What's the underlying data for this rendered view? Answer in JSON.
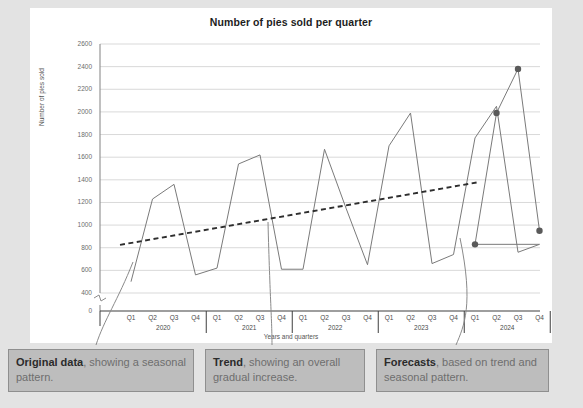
{
  "chart_data": {
    "type": "line",
    "title": "Number of pies sold per quarter",
    "xlabel": "Years and quarters",
    "ylabel": "Number of pies sold",
    "ylim": [
      400,
      2600
    ],
    "y_axis_break_at_zero": true,
    "yticks": [
      0,
      400,
      600,
      800,
      1000,
      1200,
      1400,
      1600,
      1800,
      2000,
      2200,
      2400,
      2600
    ],
    "grid": true,
    "legend_position": "none",
    "x": [
      "Q1 2020",
      "Q2 2020",
      "Q3 2020",
      "Q4 2020",
      "Q1 2021",
      "Q2 2021",
      "Q3 2021",
      "Q4 2021",
      "Q1 2022",
      "Q2 2022",
      "Q3 2022",
      "Q4 2022",
      "Q1 2023",
      "Q2 2023",
      "Q3 2023",
      "Q4 2023",
      "Q1 2024",
      "Q2 2024",
      "Q3 2024",
      "Q4 2024"
    ],
    "quarters": [
      "Q1",
      "Q2",
      "Q3",
      "Q4"
    ],
    "years": [
      "2020",
      "2021",
      "2022",
      "2023",
      "2024"
    ],
    "series": [
      {
        "name": "Original data",
        "style": "solid",
        "markers": false,
        "values": [
          500,
          1230,
          1360,
          560,
          620,
          1540,
          1620,
          610,
          610,
          1670,
          1150,
          650,
          1700,
          1990,
          660,
          740,
          1770,
          2050,
          760,
          830
        ]
      },
      {
        "name": "Forecasts",
        "style": "solid",
        "markers": true,
        "values": [
          null,
          null,
          null,
          null,
          null,
          null,
          null,
          null,
          null,
          null,
          null,
          null,
          null,
          null,
          null,
          null,
          830,
          1990,
          2380,
          950
        ],
        "points": [
          {
            "x": "Q1 2024",
            "y": 830
          },
          {
            "x": "Q2 2024",
            "y": 1990
          },
          {
            "x": "Q3 2024",
            "y": 2380
          },
          {
            "x": "Q4 2024",
            "y": 950
          }
        ]
      },
      {
        "name": "Trend",
        "style": "dashed",
        "markers": false,
        "endpoints": [
          {
            "x": "Q1 2020",
            "y": 825
          },
          {
            "x": "Q1 2024",
            "y": 1380
          }
        ]
      }
    ]
  },
  "callouts": [
    {
      "id": "original-data",
      "emphasis": "Original data",
      "rest": ", showing a seasonal pattern."
    },
    {
      "id": "trend",
      "emphasis": "Trend",
      "rest": ", showing an overall gradual increase."
    },
    {
      "id": "forecasts",
      "emphasis": "Forecasts",
      "rest": ", based on trend and seasonal pattern."
    }
  ],
  "colors": {
    "page_background": "#e3e3e3",
    "card_background": "#ffffff",
    "data_line": "#7a7a7a",
    "trend_line": "#2e2e2e",
    "marker": "#5a5a5a",
    "gridline": "#d9d9d9",
    "axis": "#8c8c8c",
    "callout_background": "#bdbdbd",
    "callout_border": "#8f8f8f",
    "callout_text": "#6e6e6e",
    "callout_emphasis": "#2b2b2b",
    "title_text": "#1d1d1d"
  }
}
